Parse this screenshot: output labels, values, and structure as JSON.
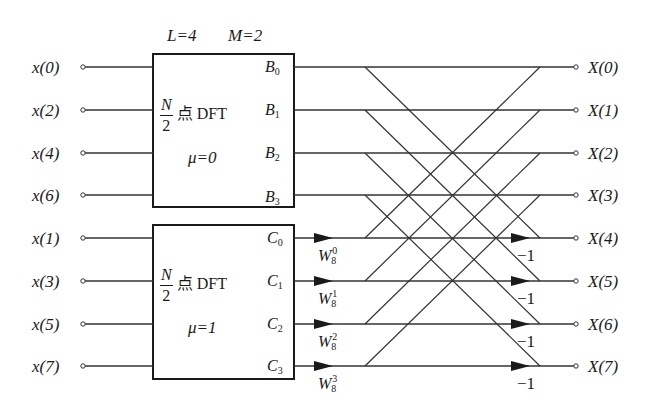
{
  "header": {
    "L_label": "L=4",
    "M_label": "M=2"
  },
  "inputs": [
    "x(0)",
    "x(2)",
    "x(4)",
    "x(6)",
    "x(1)",
    "x(3)",
    "x(5)",
    "x(7)"
  ],
  "outputs": [
    "X(0)",
    "X(1)",
    "X(2)",
    "X(3)",
    "X(4)",
    "X(5)",
    "X(6)",
    "X(7)"
  ],
  "blocks": [
    {
      "frac_num": "N",
      "frac_den": "2",
      "title": "点 DFT",
      "mu_label": "μ=0",
      "port_letter": "B",
      "ports": [
        "0",
        "1",
        "2",
        "3"
      ]
    },
    {
      "frac_num": "N",
      "frac_den": "2",
      "title": "点 DFT",
      "mu_label": "μ=1",
      "port_letter": "C",
      "ports": [
        "0",
        "1",
        "2",
        "3"
      ]
    }
  ],
  "twiddles": [
    {
      "base": "W",
      "sub": "8",
      "sup": "0"
    },
    {
      "base": "W",
      "sub": "8",
      "sup": "1"
    },
    {
      "base": "W",
      "sub": "8",
      "sup": "2"
    },
    {
      "base": "W",
      "sub": "8",
      "sup": "3"
    }
  ],
  "negations": [
    "−1",
    "−1",
    "−1",
    "−1"
  ],
  "colors": {
    "line": "#1a1a1a",
    "background": "#ffffff"
  }
}
